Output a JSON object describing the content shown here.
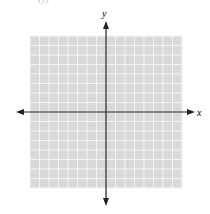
{
  "header_fragment": "(y)",
  "graph": {
    "type": "blank-coordinate-grid",
    "x_axis_label": "x",
    "y_axis_label": "y",
    "grid_cells_x": 16,
    "grid_cells_y": 16,
    "x_range": [
      -8,
      8
    ],
    "y_range": [
      -8,
      8
    ],
    "colors": {
      "grid_fill": "#d9d9d9",
      "grid_lines": "#f4f4f4",
      "axis": "#222222",
      "background": "#ffffff"
    }
  }
}
